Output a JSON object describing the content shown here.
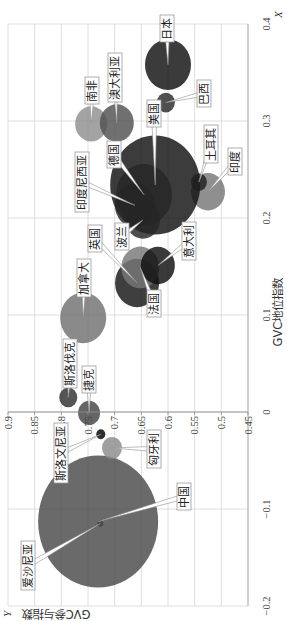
{
  "chart_data": {
    "type": "bubble",
    "title": "",
    "orientation": "rotated 90° counter-clockwise",
    "xlabel": "GVC地位指数",
    "ylabel": "GVC参与指数",
    "x_axis_letter": "X",
    "y_axis_letter": "Y",
    "xlim": [
      -0.2,
      0.4
    ],
    "ylim": [
      0.45,
      0.9
    ],
    "x_ticks": [
      -0.2,
      -0.1,
      0,
      0.1,
      0.2,
      0.3,
      0.4
    ],
    "x_tick_labels": [
      "−0.2",
      "−0.1",
      "0",
      "0.1",
      "0.2",
      "0.3",
      "0.4"
    ],
    "y_ticks": [
      0.45,
      0.5,
      0.55,
      0.6,
      0.65,
      0.7,
      0.75,
      0.8,
      0.85,
      0.9
    ],
    "y_tick_labels": [
      "0.45",
      "0.5",
      "0.55",
      "0.6",
      "0.65",
      "0.7",
      "0.75",
      "0.8",
      "0.85",
      "0.9"
    ],
    "grid": true,
    "legend": "none (data labels with callouts)",
    "bubble_opacity": 0.82,
    "series": [
      {
        "name": "爱沙尼亚",
        "x": -0.115,
        "y": 0.727,
        "size": 3,
        "color": "#303030",
        "label_pos": [
          31,
          21
        ]
      },
      {
        "name": "中国",
        "x": -0.113,
        "y": 0.731,
        "size": 60,
        "color": "#494949",
        "label_pos": [
          111,
          177
        ]
      },
      {
        "name": "匈牙利",
        "x": -0.037,
        "y": 0.705,
        "size": 10,
        "color": "#8b8b8b",
        "label_pos": [
          153,
          147
        ]
      },
      {
        "name": "斯洛文尼亚",
        "x": -0.023,
        "y": 0.726,
        "size": 4.5,
        "color": "#000000",
        "label_pos": [
          138,
          54
        ]
      },
      {
        "name": "捷克",
        "x": -0.001,
        "y": 0.748,
        "size": 11,
        "color": "#444444",
        "label_pos": [
          228,
          82
        ]
      },
      {
        "name": "斯洛伐克",
        "x": 0.015,
        "y": 0.787,
        "size": 9,
        "color": "#303030",
        "label_pos": [
          233,
          63
        ]
      },
      {
        "name": "加拿大",
        "x": 0.097,
        "y": 0.759,
        "size": 23,
        "color": "#707070",
        "label_pos": [
          324,
          77
        ]
      },
      {
        "name": "英国",
        "x": 0.133,
        "y": 0.658,
        "size": 22,
        "color": "#151515",
        "label_pos": [
          369,
          88
        ]
      },
      {
        "name": "法国",
        "x": 0.149,
        "y": 0.652,
        "size": 19,
        "color": "#787878",
        "label_pos": [
          304,
          147
        ]
      },
      {
        "name": "意大利",
        "x": 0.151,
        "y": 0.619,
        "size": 17,
        "color": "#0f0f0f",
        "label_pos": [
          361,
          182
        ]
      },
      {
        "name": "印度",
        "x": 0.227,
        "y": 0.525,
        "size": 17,
        "color": "#767676",
        "label_pos": [
          446,
          228
        ]
      },
      {
        "name": "美国",
        "x": 0.234,
        "y": 0.624,
        "size": 45,
        "color": "#111111",
        "label_pos": [
          494,
          147
        ]
      },
      {
        "name": "德国",
        "x": 0.224,
        "y": 0.645,
        "size": 28,
        "color": "#262626",
        "label_pos": [
          453,
          107
        ]
      },
      {
        "name": "印度尼西亚",
        "x": 0.213,
        "y": 0.662,
        "size": 20,
        "color": "#262626",
        "label_pos": [
          409,
          75
        ]
      },
      {
        "name": "波兰",
        "x": 0.198,
        "y": 0.647,
        "size": 17,
        "color": "#262626",
        "label_pos": [
          371,
          115
        ]
      },
      {
        "name": "土耳其",
        "x": 0.237,
        "y": 0.542,
        "size": 8,
        "color": "#1f1f1f",
        "label_pos": [
          458,
          204
        ]
      },
      {
        "name": "南非",
        "x": 0.297,
        "y": 0.744,
        "size": 16,
        "color": "#8f8f8f",
        "label_pos": [
          517,
          85
        ]
      },
      {
        "name": "澳大利亚",
        "x": 0.298,
        "y": 0.696,
        "size": 17,
        "color": "#515151",
        "label_pos": [
          519,
          108
        ]
      },
      {
        "name": "巴西",
        "x": 0.319,
        "y": 0.604,
        "size": 9,
        "color": "#2a2a2a",
        "label_pos": [
          514,
          197
        ]
      },
      {
        "name": "日本",
        "x": 0.358,
        "y": 0.6,
        "size": 23,
        "color": "#101010",
        "label_pos": [
          579,
          160
        ]
      }
    ]
  }
}
